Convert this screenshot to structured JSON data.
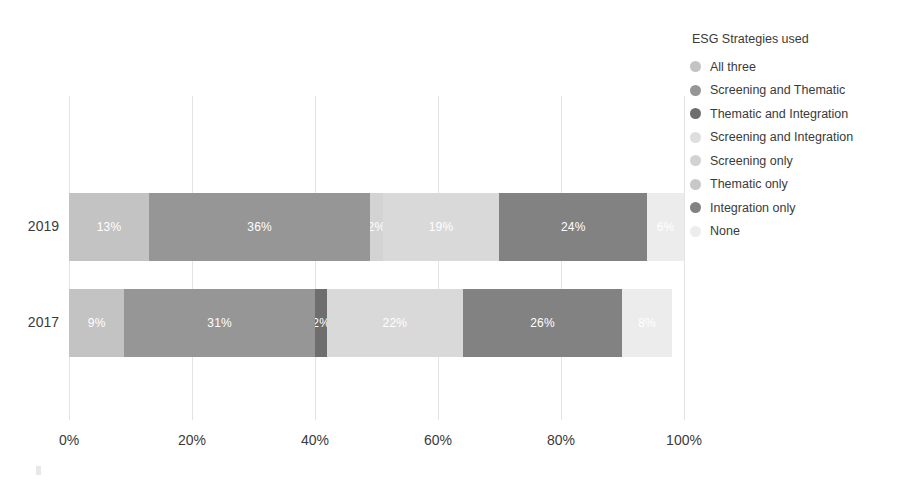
{
  "chart_data": {
    "type": "bar",
    "orientation": "horizontal",
    "stacked": true,
    "normalized": true,
    "title": "",
    "xlabel": "",
    "ylabel": "",
    "xlim": [
      0,
      100
    ],
    "xticks": [
      "0%",
      "20%",
      "40%",
      "60%",
      "80%",
      "100%"
    ],
    "xtick_values": [
      0,
      20,
      40,
      60,
      80,
      100
    ],
    "grid": "vertical",
    "categories": [
      "2019",
      "2017"
    ],
    "legend_title": "ESG Strategies used",
    "legend_position": "right",
    "series": [
      {
        "name": "All three",
        "color": "#c3c3c3",
        "values": [
          13,
          9
        ]
      },
      {
        "name": "Screening and Thematic",
        "color": "#969696",
        "values": [
          36,
          31
        ]
      },
      {
        "name": "Thematic and Integration",
        "color": "#6e6e6e",
        "values": [
          2,
          2
        ]
      },
      {
        "name": "Screening and Integration",
        "color": "#d9d9d9",
        "values": [
          19,
          22
        ]
      },
      {
        "name": "Screening only",
        "color": "#cfcfcf",
        "values": [
          0,
          0
        ]
      },
      {
        "name": "Thematic only",
        "color": "#bfbfbf",
        "values": [
          0,
          0
        ]
      },
      {
        "name": "Integration only",
        "color": "#828282",
        "values": [
          24,
          26
        ]
      },
      {
        "name": "None",
        "color": "#ececec",
        "values": [
          6,
          8
        ]
      }
    ],
    "bars": [
      {
        "category": "2019",
        "segments": [
          {
            "series": "All three",
            "value": 13,
            "label": "13%",
            "color": "#c3c3c3"
          },
          {
            "series": "Screening and Thematic",
            "value": 36,
            "label": "36%",
            "color": "#969696"
          },
          {
            "series": "Thematic and Integration",
            "value": 2,
            "label": "2%",
            "color": "#d3d3d3"
          },
          {
            "series": "Screening and Integration",
            "value": 19,
            "label": "19%",
            "color": "#d9d9d9"
          },
          {
            "series": "Integration only",
            "value": 24,
            "label": "24%",
            "color": "#828282"
          },
          {
            "series": "None",
            "value": 6,
            "label": "6%",
            "color": "#ececec"
          }
        ]
      },
      {
        "category": "2017",
        "segments": [
          {
            "series": "All three",
            "value": 9,
            "label": "9%",
            "color": "#c3c3c3"
          },
          {
            "series": "Screening and Thematic",
            "value": 31,
            "label": "31%",
            "color": "#969696"
          },
          {
            "series": "Thematic and Integration",
            "value": 2,
            "label": "2%",
            "color": "#6e6e6e"
          },
          {
            "series": "Screening and Integration",
            "value": 22,
            "label": "22%",
            "color": "#d9d9d9"
          },
          {
            "series": "Integration only",
            "value": 26,
            "label": "26%",
            "color": "#828282"
          },
          {
            "series": "None",
            "value": 8,
            "label": "8%",
            "color": "#ececec"
          }
        ]
      }
    ]
  },
  "legend": {
    "title": "ESG Strategies used",
    "items": [
      {
        "label": "All three",
        "color": "#c3c3c3"
      },
      {
        "label": "Screening and Thematic",
        "color": "#969696"
      },
      {
        "label": "Thematic and Integration",
        "color": "#6e6e6e"
      },
      {
        "label": "Screening and Integration",
        "color": "#dedede"
      },
      {
        "label": "Screening only",
        "color": "#d2d2d2"
      },
      {
        "label": "Thematic only",
        "color": "#c8c8c8"
      },
      {
        "label": "Integration only",
        "color": "#828282"
      },
      {
        "label": "None",
        "color": "#ededed"
      }
    ]
  },
  "axes": {
    "y_ticks": [
      "2019",
      "2017"
    ],
    "x_ticks": [
      "0%",
      "20%",
      "40%",
      "60%",
      "80%",
      "100%"
    ]
  }
}
